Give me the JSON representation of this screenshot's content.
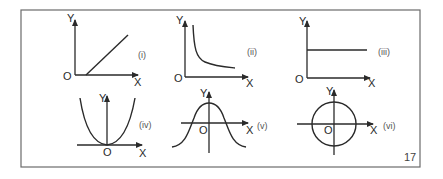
{
  "figure": {
    "page_number": "17",
    "panels": [
      {
        "id": "i",
        "label": "(i)",
        "x_axis": "X",
        "y_axis": "Y",
        "origin": "O",
        "curve": "straight line with positive slope starting on x-axis"
      },
      {
        "id": "ii",
        "label": "(ii)",
        "x_axis": "X",
        "y_axis": "Y",
        "origin": "O",
        "curve": "rectangular hyperbola"
      },
      {
        "id": "iii",
        "label": "(iii)",
        "x_axis": "X",
        "y_axis": "Y",
        "origin": "O",
        "curve": "horizontal line"
      },
      {
        "id": "iv",
        "label": "(iv)",
        "x_axis": "X",
        "y_axis": "Y",
        "origin": "O",
        "curve": "parabola opening upward, vertex at origin"
      },
      {
        "id": "v",
        "label": "(v)",
        "x_axis": "X",
        "y_axis": "Y",
        "origin": "O",
        "curve": "bell-shaped curve symmetric about y-axis"
      },
      {
        "id": "vi",
        "label": "(vi)",
        "x_axis": "X",
        "y_axis": "Y",
        "origin": "O",
        "curve": "circle centered at origin"
      }
    ]
  }
}
